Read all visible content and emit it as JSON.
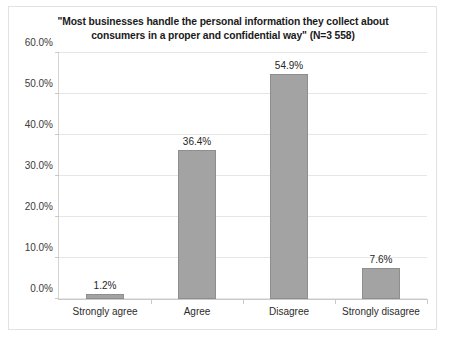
{
  "chart_data": {
    "type": "bar",
    "title": "\"Most businesses handle the personal information they collect about consumers in a proper and confidential way\" (N=3 558)",
    "title_line1": "\"Most businesses handle the personal information they collect about",
    "title_line2": "consumers in a proper and confidential way\" (N=3 558)",
    "categories": [
      "Strongly agree",
      "Agree",
      "Disagree",
      "Strongly disagree"
    ],
    "values": [
      1.2,
      36.4,
      54.9,
      7.6
    ],
    "value_labels": [
      "1.2%",
      "36.4%",
      "54.9%",
      "7.6%"
    ],
    "xlabel": "",
    "ylabel": "",
    "ylim": [
      0,
      60
    ],
    "ytick_values": [
      0,
      10,
      20,
      30,
      40,
      50,
      60
    ],
    "ytick_labels": [
      "0.0%",
      "10.0%",
      "20.0%",
      "30.0%",
      "40.0%",
      "50.0%",
      "60.0%"
    ],
    "grid": true,
    "legend": false,
    "colors": {
      "bar_fill": "#a3a3a3",
      "bar_edge": "#8e8e8e",
      "gridline": "#e6e6e6",
      "axis": "#c9c9c9",
      "text": "#262626",
      "background": "#ffffff",
      "frame": "#e2e2e2"
    }
  }
}
